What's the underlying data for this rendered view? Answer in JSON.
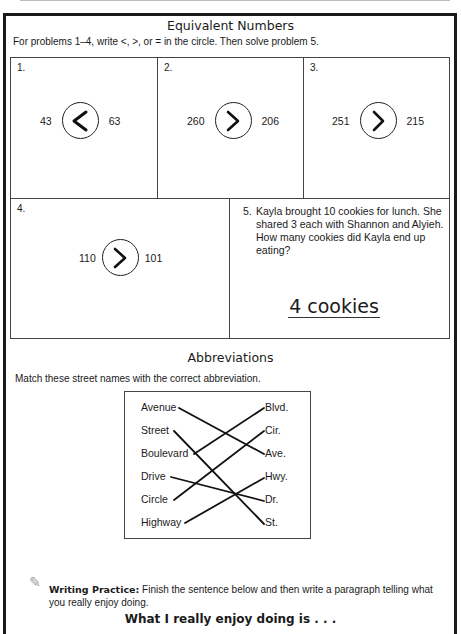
{
  "equivalent": {
    "title": "Equivalent Numbers",
    "instructions": "For problems 1–4, write <, >, or = in the circle.  Then solve problem 5.",
    "problems": [
      {
        "number": "1.",
        "left": "43",
        "symbol": "<",
        "right": "63"
      },
      {
        "number": "2.",
        "left": "260",
        "symbol": ">",
        "right": "206"
      },
      {
        "number": "3.",
        "left": "251",
        "symbol": ">",
        "right": "215"
      },
      {
        "number": "4.",
        "left": "110",
        "symbol": ">",
        "right": "101"
      }
    ],
    "word_problem": {
      "number": "5.",
      "text": "Kayla brought 10 cookies for lunch. She shared 3 each with Shannon and Alyieh.  How many cookies did Kayla end up eating?",
      "answer": "4 cookies"
    }
  },
  "abbreviations": {
    "title": "Abbreviations",
    "instructions": "Match these street names with the correct abbreviation.",
    "left_items": [
      "Avenue",
      "Street",
      "Boulevard",
      "Drive",
      "Circle",
      "Highway"
    ],
    "right_items": [
      "Blvd.",
      "Cir.",
      "Ave.",
      "Hwy.",
      "Dr.",
      "St."
    ],
    "matches": [
      {
        "from": "Avenue",
        "to": "Ave."
      },
      {
        "from": "Street",
        "to": "St."
      },
      {
        "from": "Boulevard",
        "to": "Blvd."
      },
      {
        "from": "Drive",
        "to": "Dr."
      },
      {
        "from": "Circle",
        "to": "Cir."
      },
      {
        "from": "Highway",
        "to": "Hwy."
      }
    ]
  },
  "writing": {
    "icon": "pencil-icon",
    "label": "Writing Practice:",
    "text": "  Finish the sentence below and then write a paragraph telling what you really enjoy doing.",
    "prompt": "What I really enjoy doing is . . ."
  }
}
